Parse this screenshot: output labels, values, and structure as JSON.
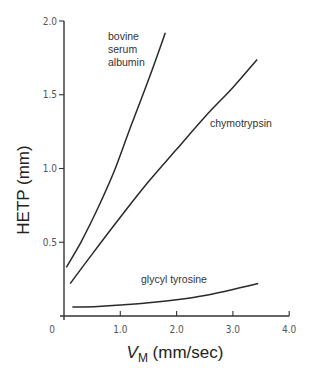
{
  "chart_data": {
    "type": "line",
    "title": "",
    "xlabel": "V_M (mm/sec)",
    "xlabel_main": "V",
    "xlabel_sub": "M",
    "xlabel_unit": " (mm/sec)",
    "ylabel": "HETP (mm)",
    "xlim": [
      0,
      4.0
    ],
    "ylim": [
      0,
      2.0
    ],
    "grid": false,
    "legend": "inline labels",
    "x_ticks": [
      0,
      1.0,
      2.0,
      3.0,
      4.0
    ],
    "x_tick_labels": [
      "0",
      "1.0",
      "2.0",
      "3.0",
      "4.0"
    ],
    "y_ticks": [
      0.5,
      1.0,
      1.5,
      2.0
    ],
    "y_tick_labels": [
      "0.5",
      "1.0",
      "1.5",
      "2.0"
    ],
    "series": [
      {
        "name": "bovine serum albumin",
        "label_lines": [
          "bovine",
          "serum",
          "albumin"
        ],
        "x": [
          0.04,
          0.3,
          0.6,
          0.9,
          1.2,
          1.5,
          1.8
        ],
        "y": [
          0.33,
          0.5,
          0.73,
          0.99,
          1.3,
          1.6,
          1.92
        ]
      },
      {
        "name": "chymotrypsin",
        "label_lines": [
          "chymotrypsin"
        ],
        "x": [
          0.11,
          0.5,
          1.0,
          1.5,
          2.0,
          2.5,
          3.0,
          3.43
        ],
        "y": [
          0.22,
          0.42,
          0.67,
          0.91,
          1.13,
          1.35,
          1.55,
          1.74
        ]
      },
      {
        "name": "glycyl tyrosine",
        "label_lines": [
          "glycyl tyrosine"
        ],
        "x": [
          0.15,
          0.6,
          1.0,
          1.5,
          2.0,
          2.5,
          3.0,
          3.45
        ],
        "y": [
          0.06,
          0.065,
          0.075,
          0.09,
          0.11,
          0.14,
          0.18,
          0.22
        ]
      }
    ]
  }
}
